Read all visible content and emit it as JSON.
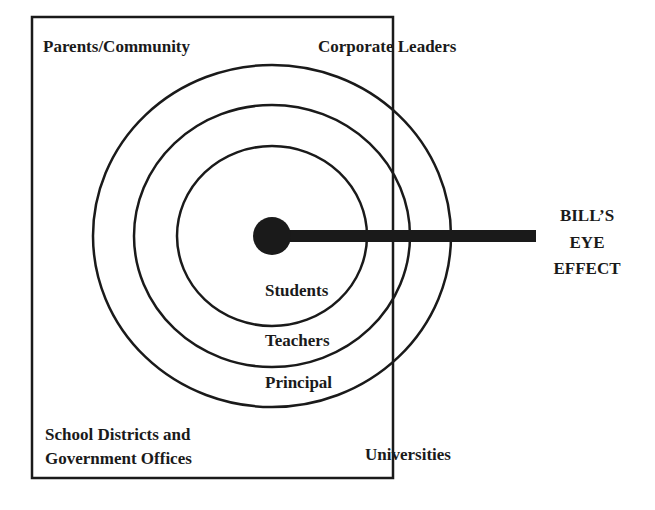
{
  "diagram": {
    "corner_labels": {
      "top_left": "Parents/Community",
      "top_right": "Corporate Leaders",
      "bottom_left_line1": "School Districts and",
      "bottom_left_line2": "Government Offices",
      "bottom_right": "Universities"
    },
    "rings": [
      {
        "label": "Students"
      },
      {
        "label": "Teachers"
      },
      {
        "label": "Principal"
      }
    ],
    "pointer_label": {
      "line1": "BILL’S",
      "line2": "EYE",
      "line3": "EFFECT"
    },
    "colors": {
      "stroke": "#1a1a1a",
      "background": "#ffffff"
    }
  }
}
